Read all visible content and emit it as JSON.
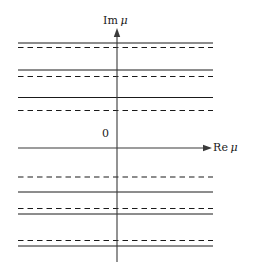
{
  "figure": {
    "title": "",
    "width": 258,
    "height": 272,
    "background_color": "#ffffff",
    "line_color": "#1a1a1a",
    "axis_color": "#3a3a3a"
  },
  "labels": {
    "imaginary_axis": "Im",
    "imaginary_axis_symbol": "μ",
    "real_axis": "Re",
    "real_axis_symbol": "μ",
    "origin": "0"
  },
  "icons": {
    "up_arrow": "arrow-up-icon",
    "right_arrow": "arrow-right-icon"
  },
  "chart_data": {
    "type": "line",
    "title": "",
    "xlabel": "Re μ",
    "ylabel": "Im μ",
    "grid": false,
    "legend": "none",
    "axes": {
      "vertical_axis_x": 117,
      "horizontal_axis_y": 148,
      "vertical_axis_top": 33,
      "vertical_axis_bottom": 262,
      "horizontal_axis_left": 18,
      "horizontal_axis_right": 207,
      "line_left": 18,
      "line_right": 213
    },
    "annotations": [
      {
        "text": "Im μ",
        "x": 117,
        "y": 20
      },
      {
        "text": "Re μ",
        "x": 215,
        "y": 147
      },
      {
        "text": "0",
        "x": 106,
        "y": 133
      }
    ],
    "series": [
      {
        "name": "horizontal-line-1",
        "style": "solid",
        "y": 43
      },
      {
        "name": "horizontal-line-2",
        "style": "dashed",
        "y": 47.5
      },
      {
        "name": "horizontal-line-3",
        "style": "solid",
        "y": 70
      },
      {
        "name": "horizontal-line-4",
        "style": "dashed",
        "y": 76.5
      },
      {
        "name": "horizontal-line-5",
        "style": "solid",
        "y": 97.5
      },
      {
        "name": "horizontal-line-6",
        "style": "dashed",
        "y": 110.5
      },
      {
        "name": "real-axis",
        "style": "solid",
        "y": 148
      },
      {
        "name": "horizontal-line-7",
        "style": "dashed",
        "y": 177
      },
      {
        "name": "horizontal-line-8",
        "style": "solid",
        "y": 192
      },
      {
        "name": "horizontal-line-9",
        "style": "dashed",
        "y": 208.5
      },
      {
        "name": "horizontal-line-10",
        "style": "solid",
        "y": 214
      },
      {
        "name": "horizontal-line-11",
        "style": "dashed",
        "y": 240.5
      },
      {
        "name": "horizontal-line-12",
        "style": "solid",
        "y": 246
      }
    ]
  }
}
